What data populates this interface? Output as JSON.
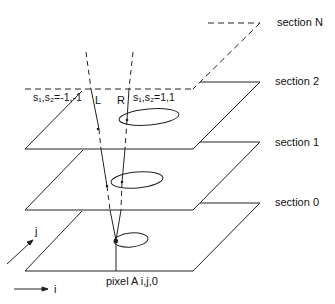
{
  "diagram": {
    "sections": [
      {
        "label": "section N",
        "style": "dashed"
      },
      {
        "label": "section 2",
        "style": "solid"
      },
      {
        "label": "section 1",
        "style": "solid"
      },
      {
        "label": "section 0",
        "style": "solid"
      }
    ],
    "rays": {
      "left_label": "L",
      "right_label": "R",
      "left_shift": "s₁,s₂=-1,-1",
      "right_shift": "s₁,s₂=1,1"
    },
    "pixel_label": "pixel A i,j,0",
    "axes": {
      "i_label": "i",
      "j_label": "j"
    },
    "colors": {
      "line": "#222222",
      "background": "#ffffff"
    }
  }
}
